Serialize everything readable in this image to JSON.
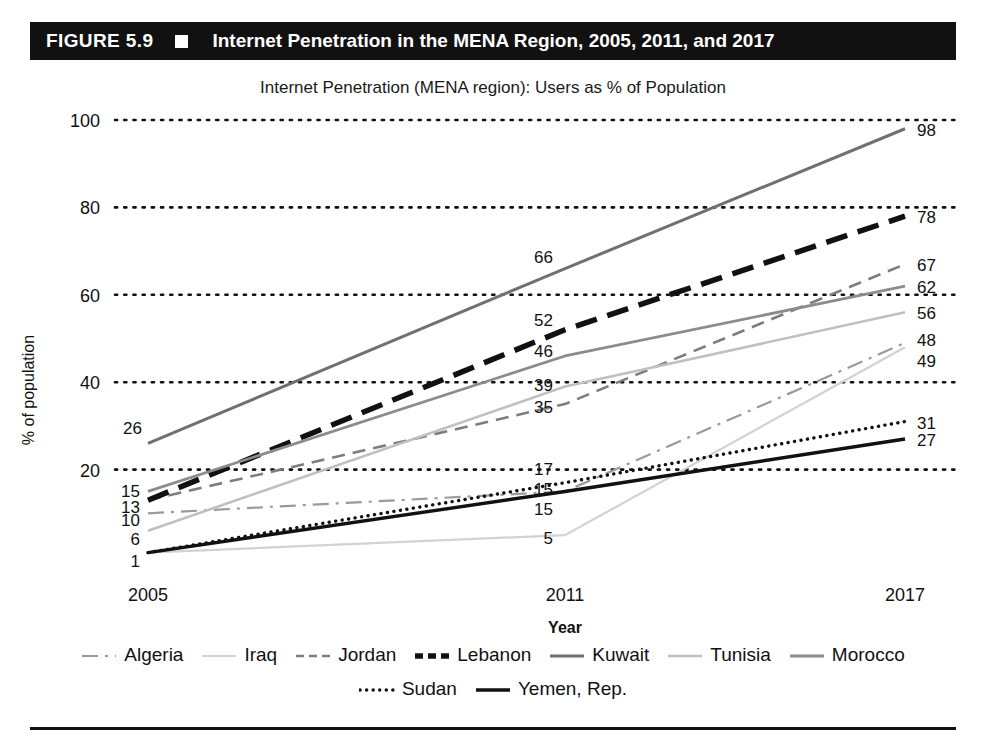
{
  "header": {
    "figure_number": "FIGURE 5.9",
    "bullet": "square-bullet",
    "title": "Internet Penetration in the MENA Region, 2005, 2011, and 2017",
    "bar_color": "#111111",
    "text_color": "#ffffff"
  },
  "chart_data": {
    "type": "line",
    "title": "Internet Penetration (MENA region): Users as % of Population",
    "xlabel": "Year",
    "ylabel": "% of population",
    "categories": [
      "2005",
      "2011",
      "2017"
    ],
    "x": [
      2005,
      2011,
      2017
    ],
    "ylim": [
      0,
      100
    ],
    "yticks": [
      20,
      40,
      60,
      80,
      100
    ],
    "ytick_labels": [
      "20",
      "40",
      "60",
      "80",
      "100"
    ],
    "grid": "horizontal-dotted",
    "legend_position": "bottom",
    "series": [
      {
        "name": "Algeria",
        "values": [
          10,
          15,
          49
        ],
        "style": "dash-dot",
        "color": "#9a9a9a",
        "width": 2.2
      },
      {
        "name": "Iraq",
        "values": [
          1,
          5,
          48
        ],
        "style": "solid",
        "color": "#d2d2d2",
        "width": 2.2
      },
      {
        "name": "Jordan",
        "values": [
          13,
          35,
          67
        ],
        "style": "dashed",
        "color": "#7d7d7d",
        "width": 2.6
      },
      {
        "name": "Lebanon",
        "values": [
          13,
          52,
          78
        ],
        "style": "dashed",
        "color": "#111111",
        "width": 5.5
      },
      {
        "name": "Kuwait",
        "values": [
          26,
          66,
          98
        ],
        "style": "solid",
        "color": "#707070",
        "width": 3.0
      },
      {
        "name": "Tunisia",
        "values": [
          6,
          39,
          56
        ],
        "style": "solid",
        "color": "#c0c0c0",
        "width": 2.6
      },
      {
        "name": "Morocco",
        "values": [
          15,
          46,
          62
        ],
        "style": "solid",
        "color": "#8c8c8c",
        "width": 2.8
      },
      {
        "name": "Sudan",
        "values": [
          1,
          17,
          31
        ],
        "style": "dotted",
        "color": "#111111",
        "width": 3.4
      },
      {
        "name": "Yemen, Rep.",
        "values": [
          1,
          15,
          27
        ],
        "style": "solid",
        "color": "#111111",
        "width": 3.4
      }
    ],
    "point_labels": {
      "2005": [
        "26",
        "15",
        "13",
        "10",
        "6",
        "1"
      ],
      "2011": [
        "66",
        "52",
        "46",
        "39",
        "35",
        "17",
        "15",
        "15",
        "5"
      ],
      "2017": [
        "98",
        "78",
        "67",
        "62",
        "56",
        "48",
        "49",
        "31",
        "27"
      ]
    }
  },
  "legend": {
    "row1": [
      {
        "label": "Algeria",
        "swatch": "dash-dot-line-swatch"
      },
      {
        "label": "Iraq",
        "swatch": "light-solid-line-swatch"
      },
      {
        "label": "Jordan",
        "swatch": "dashed-line-swatch"
      },
      {
        "label": "Lebanon",
        "swatch": "thick-black-line-swatch"
      },
      {
        "label": "Kuwait",
        "swatch": "gray-solid-line-swatch"
      },
      {
        "label": "Tunisia",
        "swatch": "light-gray-line-swatch"
      },
      {
        "label": "Morocco",
        "swatch": "gray-line-swatch"
      }
    ],
    "row2": [
      {
        "label": "Sudan",
        "swatch": "dotted-line-swatch"
      },
      {
        "label": "Yemen, Rep.",
        "swatch": "thick-solid-line-swatch"
      }
    ]
  }
}
